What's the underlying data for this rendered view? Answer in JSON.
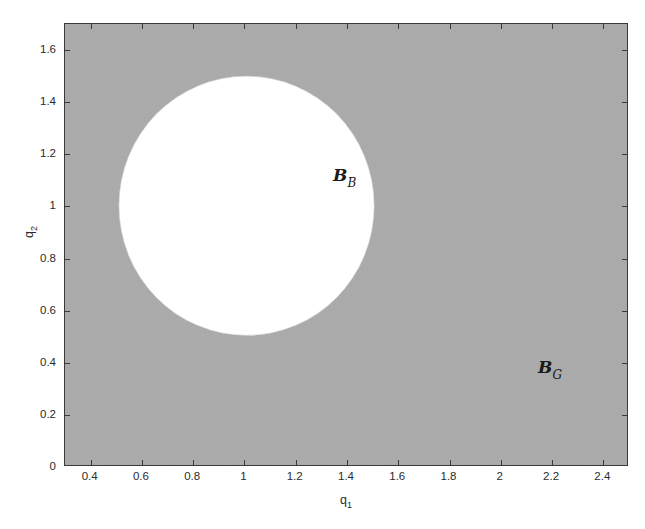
{
  "chart_data": {
    "type": "area",
    "title": "",
    "xlabel": "q1",
    "ylabel": "q2",
    "xlabel_base": "q",
    "xlabel_sub": "1",
    "ylabel_base": "q",
    "ylabel_sub": "2",
    "xlim": [
      0.3,
      2.5
    ],
    "ylim": [
      0.0,
      1.7
    ],
    "grid": false,
    "legend": "none",
    "xticks": [
      0.4,
      0.6,
      0.8,
      1,
      1.2,
      1.4,
      1.6,
      1.8,
      2,
      2.2,
      2.4
    ],
    "xticklabels": [
      "0.4",
      "0.6",
      "0.8",
      "1",
      "1.2",
      "1.4",
      "1.6",
      "1.8",
      "2",
      "2.2",
      "2.4"
    ],
    "yticks": [
      0,
      0.2,
      0.4,
      0.6,
      0.8,
      1,
      1.2,
      1.4,
      1.6
    ],
    "yticklabels": [
      "0",
      "0.2",
      "0.4",
      "0.6",
      "0.8",
      "1",
      "1.2",
      "1.4",
      "1.6"
    ],
    "regions": [
      {
        "name": "B_G",
        "label_base": "B",
        "label_sub": "G",
        "shape": "background-rectangle",
        "fill_color": "#aaaaaa",
        "description": "Shaded grey region covering the whole axes except the white disc",
        "label_position": {
          "q1": 2.0,
          "q2": 0.48
        }
      },
      {
        "name": "B_B",
        "label_base": "B",
        "label_sub": "B",
        "shape": "circle",
        "fill_color": "#ffffff",
        "center": {
          "q1": 1.0,
          "q2": 1.0
        },
        "radius": 0.5,
        "description": "White open disc of radius 0.5 centred at (1, 1)",
        "label_position": {
          "q1": 1.11,
          "q2": 1.22
        }
      }
    ],
    "colors": {
      "shaded_region": "#aaaaaa",
      "inner_region": "#ffffff",
      "axis": "#3a3a3a",
      "text": "#2b2b2b"
    }
  }
}
